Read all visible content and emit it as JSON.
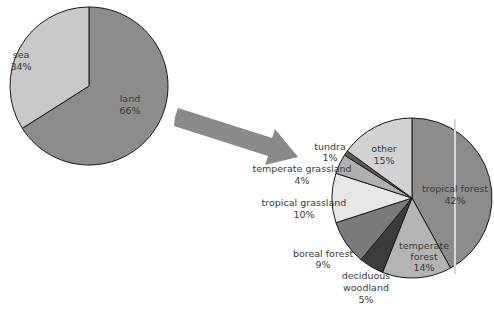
{
  "chart_data": [
    {
      "type": "pie",
      "title": "",
      "start_angle_deg": 0,
      "direction": "clockwise",
      "categories": [
        "land",
        "sea"
      ],
      "values": [
        66,
        34
      ],
      "labels": [
        "land\n66%",
        "sea\n34%"
      ],
      "colors": [
        "#8c8c8c",
        "#c8c8c8"
      ]
    },
    {
      "type": "pie",
      "title": "",
      "start_angle_deg": 0,
      "direction": "clockwise",
      "categories": [
        "tropical forest",
        "temperate forest",
        "deciduous woodland",
        "boreal forest",
        "tropical grassland",
        "temperate grassland",
        "tundra",
        "other"
      ],
      "values": [
        42,
        14,
        5,
        9,
        10,
        4,
        1,
        15
      ],
      "colors": [
        "#8c8c8c",
        "#b4b4b4",
        "#3c3c3c",
        "#7a7a7a",
        "#e6e6e6",
        "#b0b0b0",
        "#5a5a5a",
        "#d2d2d2"
      ]
    }
  ],
  "labels": {
    "land": "land",
    "land_pct": "66%",
    "sea": "sea",
    "sea_pct": "34%",
    "tropical_forest": "tropical forest",
    "tropical_forest_pct": "42%",
    "temperate_forest_1": "temperate",
    "temperate_forest_2": "forest",
    "temperate_forest_pct": "14%",
    "deciduous_1": "deciduous",
    "deciduous_2": "woodland",
    "deciduous_pct": "5%",
    "boreal_forest": "boreal forest",
    "boreal_forest_pct": "9%",
    "tropical_grassland": "tropical grassland",
    "tropical_grassland_pct": "10%",
    "temperate_grassland": "temperate grassland",
    "temperate_grassland_pct": "4%",
    "tundra": "tundra",
    "tundra_pct": "1%",
    "other": "other",
    "other_pct": "15%"
  }
}
